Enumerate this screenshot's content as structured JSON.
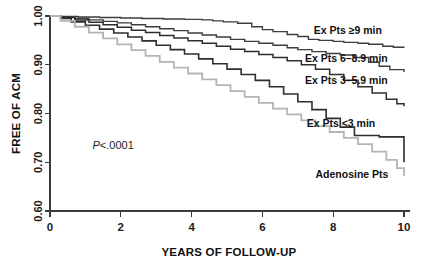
{
  "chart_data": {
    "type": "line",
    "title": "",
    "xlabel": "YEARS OF FOLLOW-UP",
    "ylabel": "FREE OF ACM",
    "xlim": [
      0,
      10
    ],
    "ylim": [
      0.6,
      1.0
    ],
    "xticks": [
      "0",
      "2",
      "4",
      "6",
      "8",
      "10"
    ],
    "xtick_values": [
      0,
      2,
      4,
      6,
      8,
      10
    ],
    "yticks": [
      "1.00",
      "0.90",
      "0.80",
      "0.70",
      "0.60"
    ],
    "ytick_values": [
      1.0,
      0.9,
      0.8,
      0.7,
      0.6
    ],
    "grid": false,
    "legend_position": "inline-right",
    "annotations": [
      {
        "name": "p-value",
        "italic_prefix": "P",
        "text": "<.0001",
        "x": 1.2,
        "y": 0.735
      }
    ],
    "series": [
      {
        "name": "Ex Pts ≥9 min",
        "label": "Ex Pts ≥9 min",
        "color": "#3d3d3d",
        "stroke_width": 1.4,
        "final_value": 0.935,
        "x": [
          0,
          0.3,
          0.8,
          1.4,
          2.0,
          2.6,
          3.2,
          3.8,
          4.3,
          4.6,
          4.9,
          5.3,
          5.7,
          6.0,
          6.3,
          6.7,
          7.0,
          7.3,
          7.6,
          8.0,
          8.3,
          8.7,
          9.0,
          9.4,
          9.7,
          10.0
        ],
        "y": [
          1.0,
          0.999,
          0.998,
          0.997,
          0.996,
          0.995,
          0.994,
          0.993,
          0.992,
          0.99,
          0.988,
          0.985,
          0.978,
          0.972,
          0.968,
          0.962,
          0.958,
          0.952,
          0.95,
          0.948,
          0.946,
          0.944,
          0.942,
          0.938,
          0.936,
          0.935
        ]
      },
      {
        "name": "Ex Pts 6–8.9 min",
        "label": "Ex Pts 6–8.9 min",
        "color": "#3d3d3d",
        "stroke_width": 1.4,
        "final_value": 0.885,
        "x": [
          0,
          0.3,
          0.7,
          1.1,
          1.5,
          1.9,
          2.3,
          2.7,
          3.1,
          3.5,
          3.9,
          4.3,
          4.7,
          5.1,
          5.5,
          5.9,
          6.3,
          6.7,
          7.0,
          7.4,
          7.8,
          8.2,
          8.6,
          9.0,
          9.3,
          9.6,
          10.0
        ],
        "y": [
          1.0,
          0.998,
          0.995,
          0.992,
          0.989,
          0.986,
          0.982,
          0.978,
          0.974,
          0.97,
          0.965,
          0.961,
          0.957,
          0.952,
          0.948,
          0.944,
          0.94,
          0.935,
          0.931,
          0.927,
          0.923,
          0.92,
          0.915,
          0.905,
          0.897,
          0.89,
          0.885
        ]
      },
      {
        "name": "Ex Pts 3–5.9 min",
        "label": "Ex Pts 3–5.9 min",
        "color": "#2e2e2e",
        "stroke_width": 1.5,
        "final_value": 0.815,
        "x": [
          0,
          0.3,
          0.7,
          1.1,
          1.5,
          1.9,
          2.3,
          2.7,
          3.1,
          3.5,
          3.9,
          4.3,
          4.7,
          5.1,
          5.5,
          5.9,
          6.3,
          6.7,
          7.1,
          7.5,
          7.9,
          8.3,
          8.7,
          9.1,
          9.5,
          9.8,
          10.0
        ],
        "y": [
          1.0,
          0.997,
          0.992,
          0.987,
          0.982,
          0.977,
          0.971,
          0.966,
          0.96,
          0.955,
          0.949,
          0.944,
          0.938,
          0.932,
          0.927,
          0.921,
          0.915,
          0.908,
          0.9,
          0.891,
          0.88,
          0.868,
          0.855,
          0.842,
          0.829,
          0.82,
          0.815
        ]
      },
      {
        "name": "Ex Pts <3 min",
        "label": "Ex Pts <3 min",
        "color": "#2e2e2e",
        "stroke_width": 1.6,
        "final_value": 0.7,
        "x": [
          0,
          0.3,
          0.6,
          1.0,
          1.4,
          1.8,
          2.2,
          2.6,
          3.0,
          3.4,
          3.8,
          4.2,
          4.6,
          5.0,
          5.4,
          5.8,
          6.2,
          6.6,
          7.0,
          7.4,
          7.8,
          8.2,
          8.6,
          9.3,
          10.0
        ],
        "y": [
          1.0,
          0.995,
          0.988,
          0.981,
          0.973,
          0.965,
          0.957,
          0.949,
          0.94,
          0.931,
          0.922,
          0.912,
          0.902,
          0.891,
          0.88,
          0.868,
          0.855,
          0.84,
          0.824,
          0.808,
          0.79,
          0.772,
          0.755,
          0.752,
          0.7
        ]
      },
      {
        "name": "Adenosine Pts",
        "label": "Adenosine Pts",
        "color": "#b4b4b4",
        "stroke_width": 1.8,
        "final_value": 0.672,
        "x": [
          0,
          0.3,
          0.7,
          1.1,
          1.5,
          1.9,
          2.3,
          2.7,
          3.1,
          3.5,
          3.9,
          4.3,
          4.7,
          5.1,
          5.5,
          5.9,
          6.3,
          6.7,
          7.1,
          7.5,
          7.9,
          8.3,
          8.7,
          9.1,
          9.5,
          9.8,
          10.0
        ],
        "y": [
          1.0,
          0.99,
          0.978,
          0.966,
          0.954,
          0.942,
          0.93,
          0.918,
          0.906,
          0.894,
          0.882,
          0.87,
          0.858,
          0.846,
          0.834,
          0.822,
          0.81,
          0.798,
          0.786,
          0.774,
          0.762,
          0.75,
          0.737,
          0.722,
          0.705,
          0.688,
          0.672
        ]
      }
    ],
    "series_label_positions": [
      {
        "name": "Ex Pts ≥9 min",
        "x": 7.45,
        "y": 0.972
      },
      {
        "name": "Ex Pts 6–8.9 min",
        "x": 7.2,
        "y": 0.914
      },
      {
        "name": "Ex Pts 3–5.9 min",
        "x": 7.2,
        "y": 0.869
      },
      {
        "name": "Ex Pts <3 min",
        "x": 7.25,
        "y": 0.781
      },
      {
        "name": "Adenosine Pts",
        "x": 7.5,
        "y": 0.676
      }
    ],
    "colors": {
      "axis": "#3a3a3a",
      "text": "#111111",
      "exercise_curves": "#2e2e2e",
      "adenosine_curve": "#b4b4b4",
      "background": "#ffffff"
    }
  }
}
